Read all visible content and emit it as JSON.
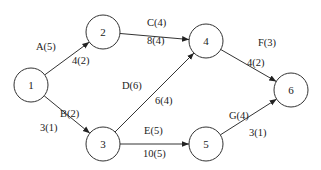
{
  "diagram": {
    "type": "activity-on-arrow network",
    "nodes": [
      {
        "id": "1",
        "label": "1",
        "x": 31,
        "y": 85
      },
      {
        "id": "2",
        "label": "2",
        "x": 103,
        "y": 32
      },
      {
        "id": "3",
        "label": "3",
        "x": 103,
        "y": 144
      },
      {
        "id": "4",
        "label": "4",
        "x": 206,
        "y": 41
      },
      {
        "id": "5",
        "label": "5",
        "x": 206,
        "y": 144
      },
      {
        "id": "6",
        "label": "6",
        "x": 291,
        "y": 90
      }
    ],
    "node_radius": 17,
    "edges": [
      {
        "from": "1",
        "to": "2",
        "activity": "A(5)",
        "value": "4(2)",
        "activity_pos": [
          36,
          50
        ],
        "value_pos": [
          72,
          64
        ]
      },
      {
        "from": "1",
        "to": "3",
        "activity": "B(2)",
        "value": "3(1)",
        "activity_pos": [
          60,
          117
        ],
        "value_pos": [
          40,
          131
        ]
      },
      {
        "from": "2",
        "to": "4",
        "activity": "C(4)",
        "value": "8(4)",
        "activity_pos": [
          147,
          26
        ],
        "value_pos": [
          147,
          44
        ]
      },
      {
        "from": "3",
        "to": "4",
        "activity": "D(6)",
        "value": "6(4)",
        "activity_pos": [
          122,
          89
        ],
        "value_pos": [
          155,
          104
        ]
      },
      {
        "from": "3",
        "to": "5",
        "activity": "E(5)",
        "value": "10(5)",
        "activity_pos": [
          144,
          134
        ],
        "value_pos": [
          143,
          157
        ]
      },
      {
        "from": "4",
        "to": "6",
        "activity": "F(3)",
        "value": "4(2)",
        "activity_pos": [
          258,
          46
        ],
        "value_pos": [
          247,
          66
        ]
      },
      {
        "from": "5",
        "to": "6",
        "activity": "G(4)",
        "value": "3(1)",
        "activity_pos": [
          229,
          119
        ],
        "value_pos": [
          249,
          136
        ]
      }
    ]
  }
}
